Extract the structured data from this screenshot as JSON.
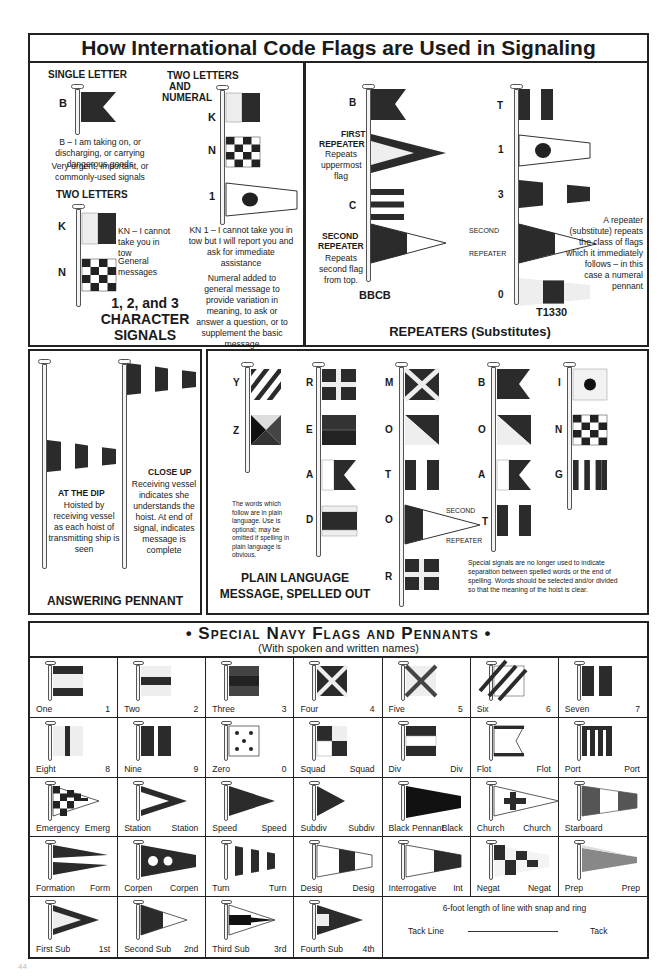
{
  "title": "How International Code Flags are Used in Signaling",
  "colors": {
    "ink": "#222222",
    "flag_dark": "#2b2b2b",
    "flag_mid": "#555555",
    "flag_light": "#e8e8e8",
    "paper": "#ffffff"
  },
  "character_signals": {
    "single_letter_heading": "SINGLE LETTER",
    "single_letter_flag": "B",
    "b_meaning": "B – I am taking on, or discharging, or carrying dangerous goods",
    "b_note": "Very urgent, important, or commonly-used signals",
    "two_letters_heading": "TWO LETTERS",
    "two_letters_flags": [
      "K",
      "N"
    ],
    "kn_meaning": "KN – I cannot take you in tow",
    "general_messages": "General messages",
    "two_letters_numeral_heading_1": "TWO LETTERS",
    "two_letters_numeral_heading_2": "AND",
    "two_letters_numeral_heading_3": "NUMERAL",
    "numeral_flags": [
      "K",
      "N",
      "1"
    ],
    "kn1_meaning": "KN 1 – I cannot take you in tow but I will report you and ask for immediate assistance",
    "numeral_note": "Numeral added to general message to provide variation in meaning, to ask or answer a question, or to supplement the basic message",
    "section_title_1": "1, 2, and 3",
    "section_title_2": "CHARACTER",
    "section_title_3": "SIGNALS"
  },
  "repeaters": {
    "hoist1_flags": [
      "B",
      "C"
    ],
    "first_repeater_title_1": "FIRST",
    "first_repeater_title_2": "REPEATER",
    "first_repeater_desc": "Repeats uppermost flag",
    "second_repeater_title_1": "SECOND",
    "second_repeater_title_2": "REPEATER",
    "second_repeater_desc": "Repeats second flag from top.",
    "hoist1_result": "BBCB",
    "hoist2_flags": [
      "T",
      "1",
      "3",
      "0"
    ],
    "second_label": "SECOND",
    "repeater_label": "REPEATER",
    "explanation": "A repeater (substitute) repeats the class of flags which it immediately follows – in this case a numeral pennant",
    "hoist2_result": "T1330",
    "section_title": "REPEATERS (Substitutes)"
  },
  "answering_pennant": {
    "dip_title": "AT THE DIP",
    "dip_desc": "Hoisted by receiving vessel as each hoist of transmitting ship is seen",
    "close_title": "CLOSE UP",
    "close_desc": "Receiving vessel indicates she understands the hoist. At end of signal, indicates message is complete",
    "section_title": "ANSWERING PENNANT"
  },
  "plain_language": {
    "hoist_yz": [
      "Y",
      "Z"
    ],
    "hoist_read": [
      "R",
      "E",
      "A",
      "D"
    ],
    "hoist_motor": [
      "M",
      "O",
      "T",
      "O",
      "R"
    ],
    "hoist_boat": [
      "B",
      "O",
      "A",
      "T"
    ],
    "hoist_ing": [
      "I",
      "N",
      "G"
    ],
    "yz_note": "The words which follow are in plain language. Use is optional; may be omitted if spelling in plain language is obvious.",
    "second_label": "SECOND",
    "repeater_label": "REPEATER",
    "special_note": "Special signals are no longer used to indicate separation between spelled words or the end of spelling. Words should be selected and/or divided so that the meaning of the hoist is clear.",
    "section_title_1": "PLAIN LANGUAGE",
    "section_title_2": "MESSAGE, SPELLED OUT"
  },
  "navy": {
    "title": "• Special Navy Flags and Pennants •",
    "subtitle": "(With spoken and written names)",
    "rows": [
      [
        {
          "name": "One",
          "abbr": "1",
          "icon": "flag-one-icon"
        },
        {
          "name": "Two",
          "abbr": "2",
          "icon": "flag-two-icon"
        },
        {
          "name": "Three",
          "abbr": "3",
          "icon": "flag-three-icon"
        },
        {
          "name": "Four",
          "abbr": "4",
          "icon": "flag-four-icon"
        },
        {
          "name": "Five",
          "abbr": "5",
          "icon": "flag-five-icon"
        },
        {
          "name": "Six",
          "abbr": "6",
          "icon": "flag-six-icon"
        },
        {
          "name": "Seven",
          "abbr": "7",
          "icon": "flag-seven-icon"
        }
      ],
      [
        {
          "name": "Eight",
          "abbr": "8",
          "icon": "flag-eight-icon"
        },
        {
          "name": "Nine",
          "abbr": "9",
          "icon": "flag-nine-icon"
        },
        {
          "name": "Zero",
          "abbr": "0",
          "icon": "flag-zero-icon"
        },
        {
          "name": "Squad",
          "abbr": "Squad",
          "icon": "flag-squad-icon"
        },
        {
          "name": "Div",
          "abbr": "Div",
          "icon": "flag-div-icon"
        },
        {
          "name": "Flot",
          "abbr": "Flot",
          "icon": "flag-flot-icon"
        },
        {
          "name": "Port",
          "abbr": "Port",
          "icon": "flag-port-icon"
        }
      ],
      [
        {
          "name": "Emergency",
          "abbr": "Emerg",
          "icon": "pennant-emergency-icon"
        },
        {
          "name": "Station",
          "abbr": "Station",
          "icon": "pennant-station-icon"
        },
        {
          "name": "Speed",
          "abbr": "Speed",
          "icon": "pennant-speed-icon"
        },
        {
          "name": "Subdiv",
          "abbr": "Subdiv",
          "icon": "pennant-subdiv-icon"
        },
        {
          "name": "Black Pennant",
          "abbr": "Black",
          "icon": "pennant-black-icon"
        },
        {
          "name": "Church",
          "abbr": "Church",
          "icon": "pennant-church-icon"
        },
        {
          "name": "Starboard",
          "abbr": "",
          "icon": "pennant-starboard-icon"
        }
      ],
      [
        {
          "name": "Formation",
          "abbr": "Form",
          "icon": "pennant-formation-icon"
        },
        {
          "name": "Corpen",
          "abbr": "Corpen",
          "icon": "pennant-corpen-icon"
        },
        {
          "name": "Turn",
          "abbr": "Turn",
          "icon": "pennant-turn-icon"
        },
        {
          "name": "Desig",
          "abbr": "Desig",
          "icon": "pennant-desig-icon"
        },
        {
          "name": "Interrogative",
          "abbr": "Int",
          "icon": "pennant-interrogative-icon"
        },
        {
          "name": "Negat",
          "abbr": "Negat",
          "icon": "pennant-negat-icon"
        },
        {
          "name": "Prep",
          "abbr": "Prep",
          "icon": "pennant-prep-icon"
        }
      ],
      [
        {
          "name": "First Sub",
          "abbr": "1st",
          "icon": "pennant-first-sub-icon"
        },
        {
          "name": "Second Sub",
          "abbr": "2nd",
          "icon": "pennant-second-sub-icon"
        },
        {
          "name": "Third Sub",
          "abbr": "3rd",
          "icon": "pennant-third-sub-icon"
        },
        {
          "name": "Fourth Sub",
          "abbr": "4th",
          "icon": "pennant-fourth-sub-icon"
        }
      ]
    ],
    "tack_note": "6-foot length of line with snap and ring",
    "tack_line_label": "Tack Line",
    "tack_label": "Tack"
  },
  "page_mark": "44"
}
